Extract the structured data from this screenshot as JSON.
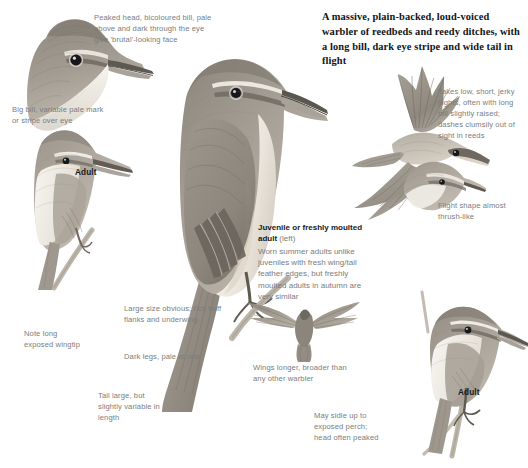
{
  "page": {
    "background": "#ffffff",
    "headline": "A massive, plain-backed, loud-voiced warbler of reedbeds and reedy ditches, with a long bill, dark eye stripe and wide tail in flight"
  },
  "palette": {
    "plumage_back": "#9b958c",
    "plumage_dark": "#6f6a62",
    "plumage_pale": "#e6e2da",
    "underpart": "#f2efe9",
    "bill_dark": "#4a4540",
    "annotation_text": "#7a7d80",
    "label_text": "#16191c",
    "headline_text": "#111418",
    "reed_stem": "#b9b2a6"
  },
  "annotations": {
    "peaked_head": "Peaked head, bicoloured bill, pale above and dark through the eye give 'brutal'-looking face",
    "big_bill": "Big bill, variable pale mark or stripe over eye",
    "takes_low": "Takes low, short, jerky flights, often with long tail slightly raised; dashes clumsily out of sight in reeds",
    "flight_shape": "Flight shape almost thrush-like",
    "large_size": "Large size obvious; rich buff flanks and underwing",
    "dark_legs": "Dark legs, pale at rear",
    "note_wingtip": "Note long exposed wingtip",
    "tail_large": "Tail large, but slightly variable in length",
    "wings_longer": "Wings longer, broader than any other warbler",
    "may_sidle": "May sidle up to exposed perch; head often peaked"
  },
  "labels": {
    "adult_left": "Adult",
    "adult_right": "Adult",
    "juvenile_title": "Juvenile or freshly moulted adult",
    "juvenile_side": "(left)",
    "juvenile_body": "Worn summer adults unlike juveniles with fresh wing/tail feather edges, but freshly moulted adults in autumn are very similar"
  },
  "figures": {
    "head_study": "head-study-bird-illustration",
    "perched_left": "perched-adult-bird-illustration",
    "main_bird": "main-perched-warbler-illustration",
    "flying_top": "flying-warbler-spread-wings-illustration",
    "perched_right_upper": "perched-warbler-right-illustration",
    "flying_center": "flying-warbler-underside-illustration",
    "perched_right_lower": "perched-adult-on-reed-illustration"
  }
}
